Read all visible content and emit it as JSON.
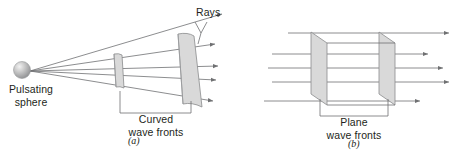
{
  "figure": {
    "background_color": "#ffffff",
    "line_color": "#6f7072",
    "wavefront_fill": "#d9d9d9",
    "wavefront_stroke": "#8a8b8d",
    "text_color": "#231f20"
  },
  "panel_a": {
    "id_label": "(a)",
    "source_label_line1": "Pulsating",
    "source_label_line2": "sphere",
    "rays_label": "Rays",
    "wavefront_label_line1": "Curved",
    "wavefront_label_line2": "wave fronts",
    "source_icon": "sphere-icon",
    "ray_count": 5,
    "wavefront_count": 2
  },
  "panel_b": {
    "id_label": "(b)",
    "wavefront_label_line1": "Plane",
    "wavefront_label_line2": "wave fronts",
    "ray_count": 5,
    "wavefront_count": 2
  }
}
